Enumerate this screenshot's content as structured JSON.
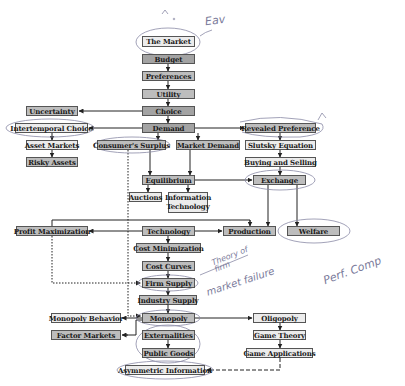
{
  "diagram": {
    "nodes": [
      {
        "id": "the_market",
        "label": "The Market",
        "shade": "light"
      },
      {
        "id": "budget",
        "label": "Budget",
        "shade": "dark"
      },
      {
        "id": "preferences",
        "label": "Preferences",
        "shade": "mid"
      },
      {
        "id": "utility",
        "label": "Utility",
        "shade": "mid"
      },
      {
        "id": "choice",
        "label": "Choice",
        "shade": "dark"
      },
      {
        "id": "demand",
        "label": "Demand",
        "shade": "dark"
      },
      {
        "id": "uncertainty",
        "label": "Uncertainty",
        "shade": "mid"
      },
      {
        "id": "intertemporal_choice",
        "label": "Intertemporal Choice",
        "shade": "light"
      },
      {
        "id": "asset_markets",
        "label": "Asset Markets",
        "shade": "light"
      },
      {
        "id": "risky_assets",
        "label": "Risky Assets",
        "shade": "mid"
      },
      {
        "id": "consumers_surplus",
        "label": "Consumer's Surplus",
        "shade": "mid"
      },
      {
        "id": "market_demand",
        "label": "Market Demand",
        "shade": "mid"
      },
      {
        "id": "equilibrium",
        "label": "Equilibrium",
        "shade": "mid"
      },
      {
        "id": "auctions",
        "label": "Auctions",
        "shade": "light"
      },
      {
        "id": "information_technology",
        "label": "Information Technology",
        "shade": "light"
      },
      {
        "id": "revealed_preference",
        "label": "Revealed Preference",
        "shade": "mid"
      },
      {
        "id": "slutsky_equation",
        "label": "Slutsky Equation",
        "shade": "light"
      },
      {
        "id": "buying_and_selling",
        "label": "Buying and Selling",
        "shade": "light"
      },
      {
        "id": "exchange",
        "label": "Exchange",
        "shade": "mid"
      },
      {
        "id": "profit_maximization",
        "label": "Profit Maximization",
        "shade": "mid"
      },
      {
        "id": "technology",
        "label": "Technology",
        "shade": "mid"
      },
      {
        "id": "production",
        "label": "Production",
        "shade": "mid"
      },
      {
        "id": "welfare",
        "label": "Welfare",
        "shade": "mid"
      },
      {
        "id": "cost_minimization",
        "label": "Cost Minimization",
        "shade": "mid"
      },
      {
        "id": "cost_curves",
        "label": "Cost Curves",
        "shade": "mid"
      },
      {
        "id": "firm_supply",
        "label": "Firm Supply",
        "shade": "mid"
      },
      {
        "id": "industry_supply",
        "label": "Industry Supply",
        "shade": "mid"
      },
      {
        "id": "monopoly",
        "label": "Monopoly",
        "shade": "mid"
      },
      {
        "id": "monopoly_behavior",
        "label": "Monopoly Behavior",
        "shade": "light"
      },
      {
        "id": "factor_markets",
        "label": "Factor Markets",
        "shade": "mid"
      },
      {
        "id": "externalities",
        "label": "Externalities",
        "shade": "mid"
      },
      {
        "id": "public_goods",
        "label": "Public Goods",
        "shade": "mid"
      },
      {
        "id": "asymmetric_information",
        "label": "Asymmetric Information",
        "shade": "light"
      },
      {
        "id": "oligopoly",
        "label": "Oligopoly",
        "shade": "light"
      },
      {
        "id": "game_theory",
        "label": "Game Theory",
        "shade": "light"
      },
      {
        "id": "game_applications",
        "label": "Game Applications",
        "shade": "light"
      }
    ],
    "edges": [
      {
        "from": "budget",
        "to": "preferences",
        "style": "solid"
      },
      {
        "from": "preferences",
        "to": "utility",
        "style": "solid"
      },
      {
        "from": "utility",
        "to": "choice",
        "style": "solid"
      },
      {
        "from": "choice",
        "to": "demand",
        "style": "solid"
      },
      {
        "from": "choice",
        "to": "uncertainty",
        "style": "solid"
      },
      {
        "from": "demand",
        "to": "intertemporal_choice",
        "style": "solid"
      },
      {
        "from": "intertemporal_choice",
        "to": "asset_markets",
        "style": "solid"
      },
      {
        "from": "asset_markets",
        "to": "risky_assets",
        "style": "solid"
      },
      {
        "from": "demand",
        "to": "revealed_preference",
        "style": "solid"
      },
      {
        "from": "revealed_preference",
        "to": "slutsky_equation",
        "style": "solid"
      },
      {
        "from": "slutsky_equation",
        "to": "buying_and_selling",
        "style": "solid"
      },
      {
        "from": "buying_and_selling",
        "to": "exchange",
        "style": "solid"
      },
      {
        "from": "demand",
        "to": "consumers_surplus",
        "style": "solid"
      },
      {
        "from": "demand",
        "to": "market_demand",
        "style": "solid"
      },
      {
        "from": "consumers_surplus",
        "to": "equilibrium",
        "style": "solid"
      },
      {
        "from": "market_demand",
        "to": "equilibrium",
        "style": "solid"
      },
      {
        "from": "equilibrium",
        "to": "auctions",
        "style": "solid"
      },
      {
        "from": "equilibrium",
        "to": "information_technology",
        "style": "solid"
      },
      {
        "from": "equilibrium",
        "to": "exchange",
        "style": "solid"
      },
      {
        "from": "exchange",
        "to": "production",
        "style": "solid"
      },
      {
        "from": "exchange",
        "to": "welfare",
        "style": "solid"
      },
      {
        "from": "technology",
        "to": "production",
        "style": "solid"
      },
      {
        "from": "technology",
        "to": "profit_maximization",
        "style": "solid"
      },
      {
        "from": "profit_maximization",
        "to": "production",
        "style": "solid"
      },
      {
        "from": "technology",
        "to": "cost_minimization",
        "style": "solid"
      },
      {
        "from": "cost_minimization",
        "to": "cost_curves",
        "style": "solid"
      },
      {
        "from": "cost_curves",
        "to": "firm_supply",
        "style": "solid"
      },
      {
        "from": "profit_maximization",
        "to": "firm_supply",
        "style": "dotted"
      },
      {
        "from": "firm_supply",
        "to": "industry_supply",
        "style": "solid"
      },
      {
        "from": "industry_supply",
        "to": "monopoly",
        "style": "solid"
      },
      {
        "from": "consumers_surplus",
        "to": "monopoly",
        "style": "dotted"
      },
      {
        "from": "monopoly",
        "to": "monopoly_behavior",
        "style": "solid"
      },
      {
        "from": "monopoly",
        "to": "factor_markets",
        "style": "solid"
      },
      {
        "from": "monopoly",
        "to": "oligopoly",
        "style": "solid"
      },
      {
        "from": "externalities",
        "to": "public_goods",
        "style": "solid"
      },
      {
        "from": "oligopoly",
        "to": "game_theory",
        "style": "solid"
      },
      {
        "from": "game_theory",
        "to": "game_applications",
        "style": "solid"
      },
      {
        "from": "game_applications",
        "to": "asymmetric_information",
        "style": "dashed"
      }
    ],
    "annotations": [
      {
        "text": "Eav",
        "near": "the_market"
      },
      {
        "text": "Theory of firm",
        "near": "cost_curves"
      },
      {
        "text": "market failure",
        "near": "firm_supply"
      },
      {
        "text": "Perf. Comp",
        "near": "welfare"
      }
    ],
    "circled": [
      "the_market",
      "intertemporal_choice",
      "consumers_surplus",
      "revealed_preference",
      "exchange",
      "welfare",
      "firm_supply",
      "monopoly",
      "externalities",
      "public_goods",
      "asymmetric_information"
    ]
  }
}
